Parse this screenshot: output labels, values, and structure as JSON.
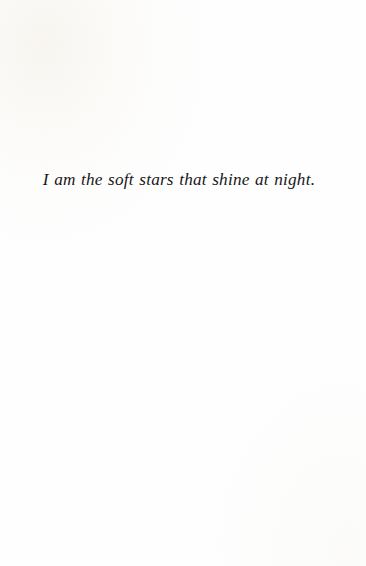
{
  "page": {
    "kind": "printed-book-page",
    "background_color": "#ffffff",
    "paper_tint_color": "#f7f4ee",
    "ink_color": "#18171a"
  },
  "body": {
    "lines": [
      {
        "text": "I am the soft stars that shine at night.",
        "style": "italic",
        "alignment": "center"
      }
    ]
  }
}
